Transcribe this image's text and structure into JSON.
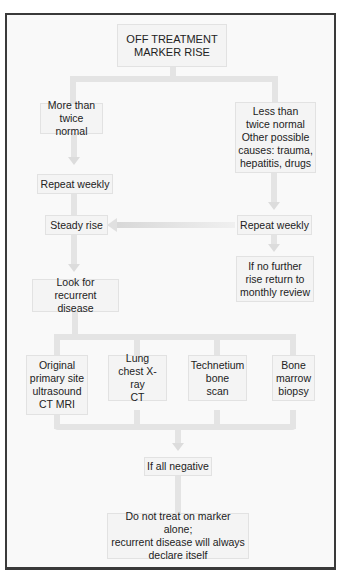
{
  "diagram": {
    "title": "OFF TREATMENT\nMARKER RISE",
    "left_branch": {
      "condition": "More than\ntwice normal",
      "step1": "Repeat weekly",
      "step2": "Steady rise",
      "step3": "Look for\nrecurrent disease"
    },
    "right_branch": {
      "condition": "Less than\ntwice normal\nOther possible\ncauses: trauma,\nhepatitis, drugs",
      "step1": "Repeat weekly",
      "step2": "If no further\nrise return to\nmonthly review"
    },
    "investigations": [
      {
        "label": "Original\nprimary site\nultrasound\nCT MRI"
      },
      {
        "label": "Lung\nchest X-ray\nCT"
      },
      {
        "label": "Technetium\nbone\nscan"
      },
      {
        "label": "Bone\nmarrow\nbiopsy"
      }
    ],
    "if_negative": "If all negative",
    "conclusion": "Do not treat on marker alone;\nrecurrent disease will always\ndeclare itself"
  }
}
